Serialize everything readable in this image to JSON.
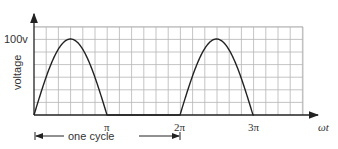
{
  "chart_data": {
    "type": "line",
    "title": "",
    "xlabel": "ωt",
    "ylabel": "voltage",
    "y_tick_labels": [
      "100v"
    ],
    "x_tick_labels": [
      "π",
      "2π",
      "3π"
    ],
    "x_ticks_radians": [
      3.1416,
      6.2832,
      9.4248
    ],
    "ylim": [
      0,
      120
    ],
    "xlim": [
      0,
      12.2
    ],
    "grid": true,
    "series": [
      {
        "name": "voltage",
        "x": [
          0,
          0.785,
          1.571,
          2.356,
          3.1416,
          4.712,
          6.2832,
          7.069,
          7.854,
          8.639,
          9.4248,
          10.5
        ],
        "values": [
          0,
          70.7,
          100,
          70.7,
          0,
          0,
          0,
          70.7,
          100,
          70.7,
          0,
          0
        ]
      }
    ],
    "annotations": [
      {
        "text": "one cycle",
        "from": "0",
        "to": "2π",
        "type": "dimension-arrow"
      }
    ]
  },
  "labels": {
    "y_peak": "100v",
    "y_axis": "voltage",
    "x_axis": "ωt",
    "pi": "π",
    "two_pi": "2π",
    "three_pi": "3π",
    "cycle": "one cycle"
  }
}
